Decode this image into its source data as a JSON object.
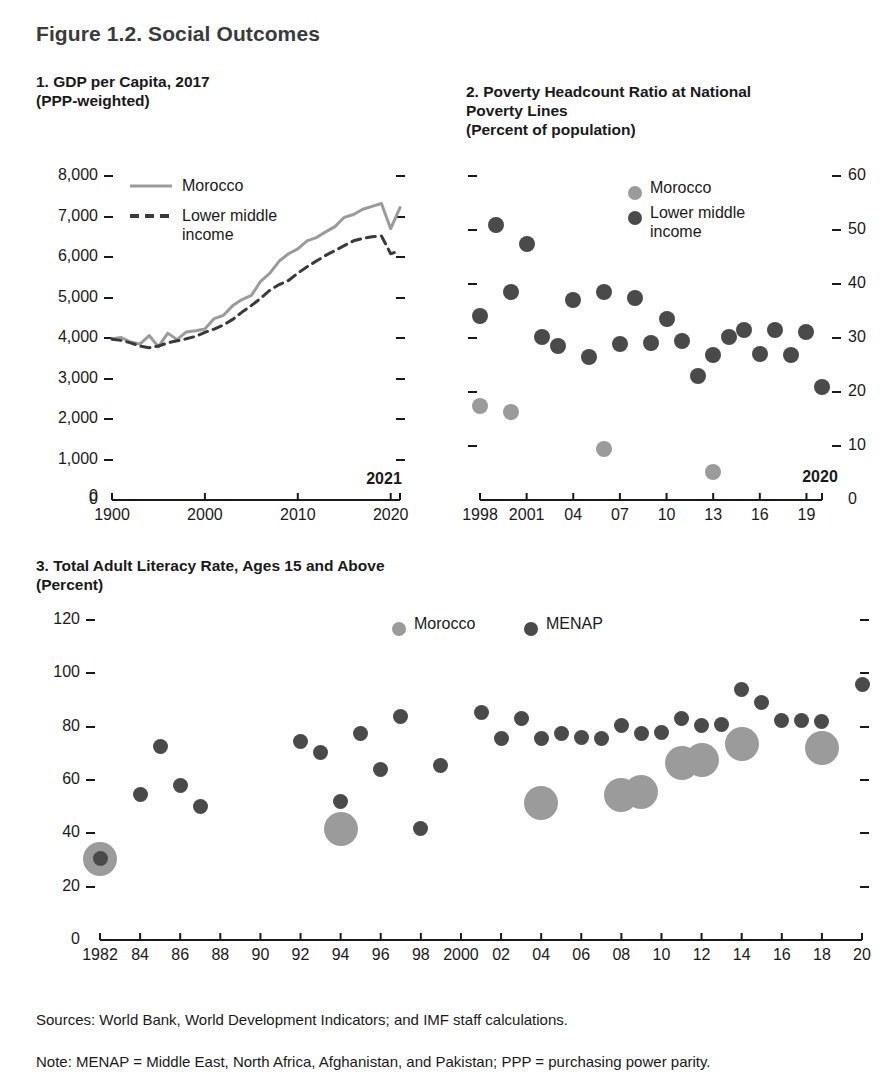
{
  "figure": {
    "title": "Figure 1.2. Social Outcomes"
  },
  "notes": {
    "sources": "Sources: World Bank, World Development Indicators; and IMF staff calculations.",
    "note": "Note: MENAP = Middle East, North Africa, Afghanistan, and Pakistan; PPP = purchasing power parity."
  },
  "colors": {
    "morocco": "#9b9b9b",
    "comparator": "#4a4a4a",
    "axis": "#1a1a1a",
    "title": "#3b3b3b"
  },
  "chart_data": [
    {
      "id": "panel1",
      "type": "line",
      "title": "1. GDP per Capita, 2017\n(PPP-weighted)",
      "xlabel": "",
      "ylabel": "",
      "ylim": [
        0,
        8000
      ],
      "xlim": [
        1990,
        2021
      ],
      "yticks": [
        "0",
        "1,000",
        "2,000",
        "3,000",
        "4,000",
        "5,000",
        "6,000",
        "7,000",
        "8,000"
      ],
      "xticks": [
        "1900",
        "2000",
        "2010",
        "2020"
      ],
      "x_end_label": "2021",
      "grid": false,
      "legend_position": "top-left",
      "series": [
        {
          "name": "Morocco",
          "style": "solid",
          "color": "#9b9b9b",
          "x": [
            1990,
            1991,
            1992,
            1993,
            1994,
            1995,
            1996,
            1997,
            1998,
            1999,
            2000,
            2001,
            2002,
            2003,
            2004,
            2005,
            2006,
            2007,
            2008,
            2009,
            2010,
            2011,
            2012,
            2013,
            2014,
            2015,
            2016,
            2017,
            2018,
            2019,
            2020,
            2021
          ],
          "values": [
            3980,
            4010,
            3900,
            3850,
            4060,
            3780,
            4120,
            3960,
            4150,
            4180,
            4220,
            4480,
            4560,
            4800,
            4950,
            5050,
            5400,
            5600,
            5900,
            6080,
            6200,
            6400,
            6480,
            6620,
            6750,
            6980,
            7050,
            7180,
            7250,
            7320,
            6700,
            7220
          ]
        },
        {
          "name": "Lower middle income",
          "style": "dashed",
          "color": "#3a3a3a",
          "x": [
            1990,
            1991,
            1992,
            1993,
            1994,
            1995,
            1996,
            1997,
            1998,
            1999,
            2000,
            2001,
            2002,
            2003,
            2004,
            2005,
            2006,
            2007,
            2008,
            2009,
            2010,
            2011,
            2012,
            2013,
            2014,
            2015,
            2016,
            2017,
            2018,
            2019,
            2020,
            2021
          ],
          "values": [
            3970,
            3940,
            3880,
            3800,
            3760,
            3800,
            3880,
            3930,
            3980,
            4040,
            4140,
            4220,
            4320,
            4460,
            4640,
            4800,
            4980,
            5180,
            5320,
            5420,
            5600,
            5760,
            5900,
            6040,
            6160,
            6280,
            6400,
            6460,
            6500,
            6520,
            6080,
            6150
          ]
        }
      ]
    },
    {
      "id": "panel2",
      "type": "scatter",
      "title": "2. Poverty Headcount Ratio at National\nPoverty Lines\n(Percent of population)",
      "ylim": [
        0,
        60
      ],
      "xlim": [
        1998,
        2020
      ],
      "yticks": [
        "0",
        "10",
        "20",
        "30",
        "40",
        "50",
        "60"
      ],
      "xticks": [
        "1998",
        "2001",
        "04",
        "07",
        "10",
        "13",
        "16",
        "19"
      ],
      "x_end_label": "2020",
      "grid": false,
      "legend_position": "top-center",
      "series": [
        {
          "name": "Morocco",
          "color": "#9b9b9b",
          "points": [
            {
              "x": 1998,
              "y": 17.5
            },
            {
              "x": 2000,
              "y": 16.3
            },
            {
              "x": 2006,
              "y": 9.5
            },
            {
              "x": 2013,
              "y": 5.2
            }
          ]
        },
        {
          "name": "Lower middle income",
          "color": "#4a4a4a",
          "points": [
            {
              "x": 1998,
              "y": 34.0
            },
            {
              "x": 1999,
              "y": 51.0
            },
            {
              "x": 2000,
              "y": 38.5
            },
            {
              "x": 2001,
              "y": 47.5
            },
            {
              "x": 2002,
              "y": 30.2
            },
            {
              "x": 2003,
              "y": 28.5
            },
            {
              "x": 2004,
              "y": 37.0
            },
            {
              "x": 2005,
              "y": 26.5
            },
            {
              "x": 2006,
              "y": 38.5
            },
            {
              "x": 2007,
              "y": 28.8
            },
            {
              "x": 2008,
              "y": 37.5
            },
            {
              "x": 2009,
              "y": 29.0
            },
            {
              "x": 2010,
              "y": 33.5
            },
            {
              "x": 2011,
              "y": 29.5
            },
            {
              "x": 2012,
              "y": 23.0
            },
            {
              "x": 2013,
              "y": 26.8
            },
            {
              "x": 2014,
              "y": 30.2
            },
            {
              "x": 2015,
              "y": 31.5
            },
            {
              "x": 2016,
              "y": 27.0
            },
            {
              "x": 2017,
              "y": 31.5
            },
            {
              "x": 2018,
              "y": 26.8
            },
            {
              "x": 2019,
              "y": 31.2
            },
            {
              "x": 2020,
              "y": 21.0
            }
          ]
        }
      ]
    },
    {
      "id": "panel3",
      "type": "scatter",
      "title": "3. Total Adult Literacy Rate, Ages 15 and Above\n(Percent)",
      "ylim": [
        0,
        120
      ],
      "xlim": [
        1982,
        2020
      ],
      "yticks": [
        "0",
        "20",
        "40",
        "60",
        "80",
        "100",
        "120"
      ],
      "xticks": [
        "1982",
        "84",
        "86",
        "88",
        "90",
        "92",
        "94",
        "96",
        "98",
        "2000",
        "02",
        "04",
        "06",
        "08",
        "10",
        "12",
        "14",
        "16",
        "18",
        "20"
      ],
      "grid": false,
      "legend_position": "top-center",
      "series": [
        {
          "name": "Morocco",
          "color": "#9b9b9b",
          "points": [
            {
              "x": 1982,
              "y": 30.5,
              "size": 26
            },
            {
              "x": 1994,
              "y": 41.5,
              "size": 26
            },
            {
              "x": 2004,
              "y": 51.5,
              "size": 26
            },
            {
              "x": 2008,
              "y": 54.5,
              "size": 26
            },
            {
              "x": 2009,
              "y": 55.5,
              "size": 26
            },
            {
              "x": 2011,
              "y": 66.5,
              "size": 26
            },
            {
              "x": 2012,
              "y": 67.5,
              "size": 26
            },
            {
              "x": 2014,
              "y": 73.5,
              "size": 26
            },
            {
              "x": 2018,
              "y": 72.0,
              "size": 26
            }
          ]
        },
        {
          "name": "MENAP",
          "color": "#4a4a4a",
          "points": [
            {
              "x": 1982,
              "y": 30.5,
              "size": 15
            },
            {
              "x": 1984,
              "y": 54.5,
              "size": 15
            },
            {
              "x": 1985,
              "y": 72.5,
              "size": 15
            },
            {
              "x": 1986,
              "y": 58.0,
              "size": 15
            },
            {
              "x": 1987,
              "y": 50.0,
              "size": 15
            },
            {
              "x": 1992,
              "y": 74.5,
              "size": 15
            },
            {
              "x": 1993,
              "y": 70.5,
              "size": 15
            },
            {
              "x": 1994,
              "y": 52.0,
              "size": 15
            },
            {
              "x": 1995,
              "y": 77.5,
              "size": 15
            },
            {
              "x": 1996,
              "y": 64.0,
              "size": 15
            },
            {
              "x": 1997,
              "y": 84.0,
              "size": 15
            },
            {
              "x": 1998,
              "y": 42.0,
              "size": 15
            },
            {
              "x": 1999,
              "y": 65.5,
              "size": 15
            },
            {
              "x": 2001,
              "y": 85.5,
              "size": 15
            },
            {
              "x": 2002,
              "y": 75.5,
              "size": 15
            },
            {
              "x": 2003,
              "y": 83.0,
              "size": 15
            },
            {
              "x": 2004,
              "y": 75.5,
              "size": 15
            },
            {
              "x": 2005,
              "y": 77.5,
              "size": 15
            },
            {
              "x": 2006,
              "y": 76.0,
              "size": 15
            },
            {
              "x": 2007,
              "y": 75.5,
              "size": 15
            },
            {
              "x": 2008,
              "y": 80.5,
              "size": 15
            },
            {
              "x": 2009,
              "y": 77.5,
              "size": 15
            },
            {
              "x": 2010,
              "y": 78.0,
              "size": 15
            },
            {
              "x": 2011,
              "y": 83.0,
              "size": 15
            },
            {
              "x": 2012,
              "y": 80.5,
              "size": 15
            },
            {
              "x": 2013,
              "y": 81.0,
              "size": 15
            },
            {
              "x": 2014,
              "y": 94.0,
              "size": 15
            },
            {
              "x": 2015,
              "y": 89.0,
              "size": 15
            },
            {
              "x": 2016,
              "y": 82.5,
              "size": 15
            },
            {
              "x": 2017,
              "y": 82.5,
              "size": 15
            },
            {
              "x": 2018,
              "y": 82.0,
              "size": 15
            },
            {
              "x": 2020,
              "y": 96.0,
              "size": 15
            }
          ]
        }
      ]
    }
  ]
}
